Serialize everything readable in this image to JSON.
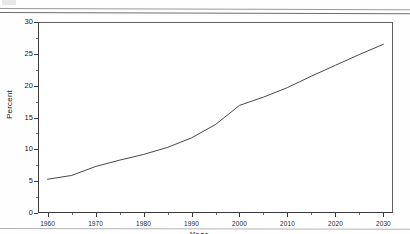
{
  "document": {
    "kind": "scanned-figure-page",
    "top_rule": true,
    "bottom_rule": true
  },
  "chart_data": {
    "type": "line",
    "title": "",
    "xlabel": "Year",
    "ylabel": "Percent",
    "xlim": [
      1958,
      2032
    ],
    "ylim": [
      0,
      30
    ],
    "grid": false,
    "legend": null,
    "line_color": "#333333",
    "x_major_ticks": [
      1960,
      1970,
      1980,
      1990,
      2000,
      2010,
      2020,
      2030
    ],
    "x_minor_ticks": [
      1965,
      1975,
      1985,
      1995,
      2005,
      2015,
      2025
    ],
    "y_major_ticks": [
      0,
      5,
      10,
      15,
      20,
      25,
      30
    ],
    "y_minor_ticks": [
      2.5,
      7.5,
      12.5,
      17.5,
      22.5,
      27.5
    ],
    "x_tick_labels": [
      "1960",
      "1970",
      "1980",
      "1990",
      "2000",
      "2010",
      "2020",
      "2030"
    ],
    "y_tick_labels": [
      "0",
      "5",
      "10",
      "15",
      "20",
      "25",
      "30"
    ],
    "series": [
      {
        "name": "Percent",
        "x": [
          1960,
          1965,
          1970,
          1975,
          1980,
          1985,
          1990,
          1995,
          2000,
          2005,
          2010,
          2015,
          2020,
          2025,
          2030
        ],
        "values": [
          5.3,
          5.9,
          7.3,
          8.3,
          9.2,
          10.3,
          11.8,
          13.9,
          16.9,
          18.2,
          19.7,
          21.5,
          23.2,
          24.9,
          26.5
        ]
      }
    ]
  }
}
